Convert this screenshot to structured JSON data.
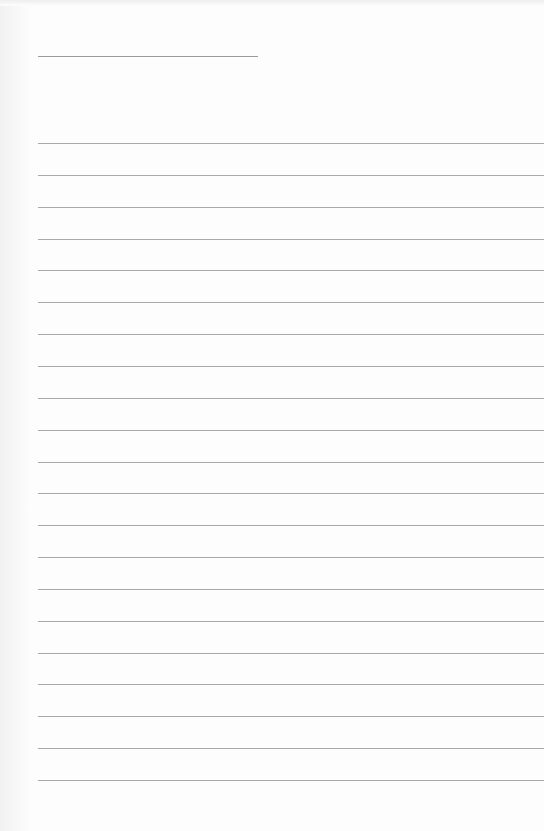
{
  "page": {
    "type": "lined-paper",
    "background": "#fdfdfd",
    "line_color": "#a8a8a8",
    "title_line": {
      "x": 38,
      "y": 56,
      "width": 220
    },
    "ruled_lines": {
      "count": 21,
      "start_y": 143,
      "spacing": 31.85,
      "x": 38
    }
  }
}
